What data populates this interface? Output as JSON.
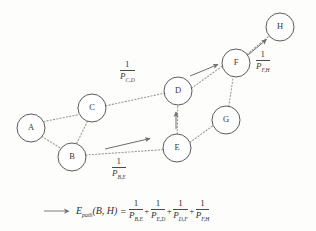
{
  "figure": {
    "type": "graph-diagram",
    "background_color": "#fdfdfc",
    "stroke_color": "#4a4a48",
    "edge_color": "#9a9a96",
    "arrow_color": "#6e6e6a"
  },
  "nodes": [
    {
      "id": "A",
      "label": "A",
      "cx": 31,
      "cy": 128,
      "r": 14
    },
    {
      "id": "B",
      "label": "B",
      "cx": 72,
      "cy": 157,
      "r": 14
    },
    {
      "id": "C",
      "label": "C",
      "cx": 92,
      "cy": 108,
      "r": 14
    },
    {
      "id": "D",
      "label": "D",
      "cx": 178,
      "cy": 91,
      "r": 14
    },
    {
      "id": "E",
      "label": "E",
      "cx": 177,
      "cy": 148,
      "r": 14
    },
    {
      "id": "F",
      "label": "F",
      "cx": 236,
      "cy": 63,
      "r": 14
    },
    {
      "id": "G",
      "label": "G",
      "cx": 226,
      "cy": 120,
      "r": 14
    },
    {
      "id": "H",
      "label": "H",
      "cx": 280,
      "cy": 27,
      "r": 14
    }
  ],
  "edges": [
    {
      "from": "A",
      "to": "C",
      "style": "dotted"
    },
    {
      "from": "A",
      "to": "B",
      "style": "dotted"
    },
    {
      "from": "C",
      "to": "B",
      "style": "dotted"
    },
    {
      "from": "C",
      "to": "D",
      "style": "dotted"
    },
    {
      "from": "B",
      "to": "E",
      "style": "dotted"
    },
    {
      "from": "E",
      "to": "D",
      "style": "dotted"
    },
    {
      "from": "E",
      "to": "G",
      "style": "dotted"
    },
    {
      "from": "G",
      "to": "F",
      "style": "dotted"
    },
    {
      "from": "D",
      "to": "F",
      "style": "dotted"
    },
    {
      "from": "F",
      "to": "H",
      "style": "dotted"
    }
  ],
  "path_arrows": [
    {
      "name": "arrow-b-e",
      "from": "B",
      "to": "E",
      "x1": 105,
      "y1": 149,
      "x2": 152,
      "y2": 138
    },
    {
      "name": "arrow-e-d",
      "from": "E",
      "to": "D",
      "x1": 176,
      "y1": 129,
      "x2": 176,
      "y2": 110
    },
    {
      "name": "arrow-d-f",
      "from": "D",
      "to": "F",
      "x1": 190,
      "y1": 76,
      "x2": 220,
      "y2": 64
    },
    {
      "name": "arrow-f-h",
      "from": "F",
      "to": "H",
      "x1": 245,
      "y1": 57,
      "x2": 268,
      "y2": 38
    }
  ],
  "edge_labels": [
    {
      "name": "label-cd",
      "numerator": "1",
      "denominator": "P",
      "subscript": "C,D",
      "x": 120,
      "y": 62
    },
    {
      "name": "label-be",
      "numerator": "1",
      "denominator": "P",
      "subscript": "B,E",
      "x": 112,
      "y": 158
    },
    {
      "name": "label-fh",
      "numerator": "1",
      "denominator": "P",
      "subscript": "F,H",
      "x": 256,
      "y": 52
    }
  ],
  "formula": {
    "lhs_symbol": "E",
    "lhs_subscript": "path",
    "lhs_args": "(B, H)",
    "equals": "=",
    "plus": "+",
    "terms": [
      {
        "numerator": "1",
        "denominator": "P",
        "subscript": "B,E"
      },
      {
        "numerator": "1",
        "denominator": "P",
        "subscript": "E,D"
      },
      {
        "numerator": "1",
        "denominator": "P",
        "subscript": "D,F"
      },
      {
        "numerator": "1",
        "denominator": "P",
        "subscript": "F,H"
      }
    ]
  }
}
